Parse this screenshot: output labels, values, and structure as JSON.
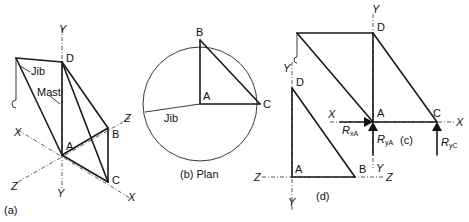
{
  "figure": {
    "panel_a": {
      "caption": "(a)",
      "labels": {
        "jib": "Jib",
        "mast": "Mast",
        "D": "D",
        "A": "A",
        "B": "B",
        "C": "C"
      },
      "axes": {
        "y_top": "Y",
        "y_bottom": "Y",
        "x_left": "X",
        "x_right": "X",
        "z_left": "Z",
        "z_right": "Z"
      }
    },
    "panel_b": {
      "caption": "(b) Plan",
      "labels": {
        "jib": "Jib",
        "A": "A",
        "B": "B",
        "C": "C"
      }
    },
    "panel_c": {
      "caption": "(c)",
      "labels": {
        "D": "D",
        "A": "A",
        "C": "C"
      },
      "axes": {
        "y_top": "Y",
        "y_bottom": "Y",
        "x_left": "X",
        "x_right": "X"
      },
      "reactions": {
        "RxA": "R",
        "RxA_sub": "xA",
        "RyA": "R",
        "RyA_sub": "yA",
        "RyC": "R",
        "RyC_sub": "yC"
      }
    },
    "panel_d": {
      "caption": "(d)",
      "labels": {
        "D": "D",
        "A": "A",
        "B": "B"
      },
      "axes": {
        "y_top": "Y",
        "y_bottom": "Y",
        "z_left": "Z",
        "z_right": "Z"
      }
    }
  }
}
